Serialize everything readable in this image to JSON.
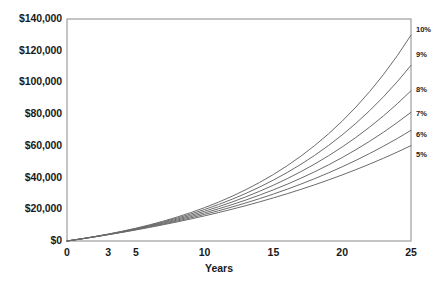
{
  "chart_data": {
    "type": "line",
    "title": "",
    "xlabel": "Years",
    "ylabel": "",
    "x": [
      0,
      1,
      2,
      3,
      4,
      5,
      6,
      7,
      8,
      9,
      10,
      11,
      12,
      13,
      14,
      15,
      16,
      17,
      18,
      19,
      20,
      21,
      22,
      23,
      24,
      25
    ],
    "xlim": [
      0,
      25
    ],
    "ylim": [
      0,
      140000
    ],
    "grid": false,
    "legend_position": "right-outside",
    "x_tick_labels": [
      "0",
      "3",
      "5",
      "10",
      "15",
      "20",
      "25"
    ],
    "x_tick_values": [
      0,
      3,
      5,
      10,
      15,
      20,
      25
    ],
    "y_tick_labels": [
      "$0",
      "$20,000",
      "$40,000",
      "$60,000",
      "$80,000",
      "$100,000",
      "$120,000",
      "$140,000"
    ],
    "y_tick_values": [
      0,
      20000,
      40000,
      60000,
      80000,
      100000,
      120000,
      140000
    ],
    "series": [
      {
        "name": "5%",
        "color": "#6b6b6b",
        "end_value": 54000,
        "values": [
          0,
          1260,
          2583,
          3972,
          5431,
          6963,
          8571,
          10260,
          12033,
          13894,
          15849,
          17901,
          20056,
          22319,
          24695,
          27190,
          29809,
          32560,
          35448,
          38480,
          41664,
          45007,
          48518,
          52204,
          56074,
          60138
        ]
      },
      {
        "name": "6%",
        "color": "#6b6b6b",
        "end_value": 67000,
        "values": [
          0,
          1272,
          2620,
          4050,
          5565,
          7171,
          8873,
          10678,
          12590,
          14618,
          16767,
          19045,
          21460,
          24020,
          26733,
          29609,
          32658,
          35890,
          39315,
          42946,
          46795,
          50874,
          55199,
          59783,
          64642,
          69792
        ]
      },
      {
        "name": "7%",
        "color": "#6b6b6b",
        "end_value": 80000,
        "values": [
          0,
          1284,
          2658,
          4128,
          5701,
          7384,
          9185,
          11112,
          13173,
          15379,
          17740,
          20265,
          22967,
          25858,
          28951,
          32261,
          35803,
          39593,
          43649,
          47988,
          52631,
          57599,
          62915,
          68603,
          74689,
          81201
        ]
      },
      {
        "name": "8%",
        "color": "#6b6b6b",
        "end_value": 95000,
        "values": [
          0,
          1296,
          2696,
          4208,
          5840,
          7603,
          9507,
          11564,
          13785,
          16183,
          18774,
          21572,
          24594,
          27857,
          31382,
          35189,
          39300,
          43741,
          48536,
          53715,
          59308,
          65349,
          71873,
          78919,
          86529,
          94747
        ]
      },
      {
        "name": "9%",
        "color": "#6b6b6b",
        "end_value": 117000,
        "values": [
          0,
          1308,
          2734,
          4288,
          5982,
          7828,
          9841,
          12035,
          14426,
          17033,
          19874,
          22971,
          26346,
          30025,
          34035,
          38406,
          43170,
          48364,
          54025,
          60196,
          66922,
          74254,
          82245,
          90955,
          100449,
          110797
        ]
      },
      {
        "name": "10%",
        "color": "#6b6b6b",
        "end_value": 133000,
        "values": [
          0,
          1320,
          2772,
          4369,
          6126,
          8059,
          10185,
          12523,
          15096,
          17925,
          21038,
          24461,
          28228,
          32370,
          36927,
          41940,
          47454,
          53520,
          60192,
          67531,
          75604,
          84485,
          94253,
          104999,
          116819,
          129820
        ]
      }
    ]
  },
  "axes": {
    "frame_color": "#8a8a8a",
    "plot_left": 67,
    "plot_right": 411,
    "plot_top": 19,
    "plot_bottom": 241
  }
}
